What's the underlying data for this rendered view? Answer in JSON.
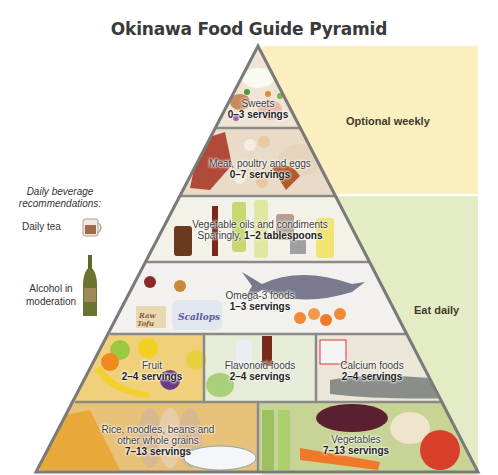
{
  "title": "Okinawa Food Guide Pyramid",
  "bands": {
    "weekly": {
      "label": "Optional weekly",
      "color": "#fbefc0"
    },
    "daily": {
      "label": "Eat daily",
      "color": "#e4ecc6"
    }
  },
  "beverages": {
    "heading_line1": "Daily beverage",
    "heading_line2": "recommendations:",
    "tea": {
      "label": "Daily tea",
      "icon": "tea-mug-icon"
    },
    "alcohol": {
      "label_line1": "Alcohol in",
      "label_line2": "moderation",
      "icon": "wine-bottle-icon"
    }
  },
  "tiers": [
    {
      "name": "Sweets",
      "servings": "0–3 servings",
      "frequency": "weekly"
    },
    {
      "name": "Meat, poultry and eggs",
      "servings": "0–7 servings",
      "frequency": "weekly"
    },
    {
      "name": "Vegetable oils and condiments",
      "servings_prefix": "Sparingly, ",
      "servings": "1–2 tablespoons",
      "frequency": "daily"
    },
    {
      "name": "Omega-3 foods",
      "servings": "1–3 servings",
      "frequency": "daily"
    },
    {
      "sections": [
        {
          "name": "Fruit",
          "servings": "2–4 servings"
        },
        {
          "name": "Flavonoid foods",
          "servings": "2–4 servings"
        },
        {
          "name": "Calcium foods",
          "servings": "2–4 servings"
        }
      ],
      "frequency": "daily"
    },
    {
      "sections": [
        {
          "name_line1": "Rice, noodles, beans and",
          "name_line2": "other whole grains",
          "servings": "7–13 servings"
        },
        {
          "name": "Vegetables",
          "servings": "7–13 servings"
        }
      ],
      "frequency": "daily"
    }
  ],
  "food_labels": {
    "tofu": "Raw Tofu",
    "scallops": "Scallops",
    "yogurt": "Yogurt",
    "mayo": "mayo",
    "spice": "spice"
  },
  "colors": {
    "pyramid_border": "#7a7a7a",
    "sweets": "#efe4d6",
    "meat": "#eadbc8",
    "oils": "#f4f2e8",
    "omega": "#f3f1ee",
    "fruit": "#f0d07a",
    "flavonoid": "#e6ecd8",
    "calcium": "#ece6d8",
    "grains": "#e8c27a",
    "vegetables": "#c8d496"
  }
}
